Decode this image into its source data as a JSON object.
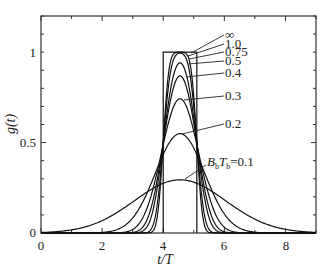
{
  "chart_data": {
    "type": "line",
    "title": "",
    "xlabel": "t/T",
    "ylabel": "g(t)",
    "xlim": [
      0,
      9
    ],
    "ylim": [
      0,
      1.2
    ],
    "grid": false,
    "x_ticks": [
      "0",
      "2",
      "4",
      "6",
      "8"
    ],
    "y_ticks": [
      "0",
      "0.5",
      "1"
    ],
    "pulse": {
      "start": 4.0,
      "end": 5.1,
      "height": 1.0,
      "label": "∞"
    },
    "center": 4.55,
    "series": [
      {
        "name": "∞",
        "BT": null,
        "peak": 1.0
      },
      {
        "name": "1.0",
        "BT": 1.0,
        "peak": 1.0
      },
      {
        "name": "0.75",
        "BT": 0.75,
        "peak": 0.995
      },
      {
        "name": "0.5",
        "BT": 0.5,
        "peak": 0.94
      },
      {
        "name": "0.4",
        "BT": 0.4,
        "peak": 0.87
      },
      {
        "name": "0.3",
        "BT": 0.3,
        "peak": 0.74
      },
      {
        "name": "0.2",
        "BT": 0.2,
        "peak": 0.55
      },
      {
        "name": "BbTb=0.1",
        "BT": 0.1,
        "peak": 0.29
      }
    ],
    "annotations": [
      "∞",
      "1.0",
      "0.75",
      "0.5",
      "0.4",
      "0.3",
      "0.2",
      "BbTb=0.1"
    ]
  },
  "labels": {
    "x_axis": "t/T",
    "y_axis": "g(t)",
    "inf": "∞",
    "b10": "1.0",
    "b075": "0.75",
    "b05": "0.5",
    "b04": "0.4",
    "b03": "0.3",
    "b02": "0.2",
    "b01_value": "=0.1"
  }
}
